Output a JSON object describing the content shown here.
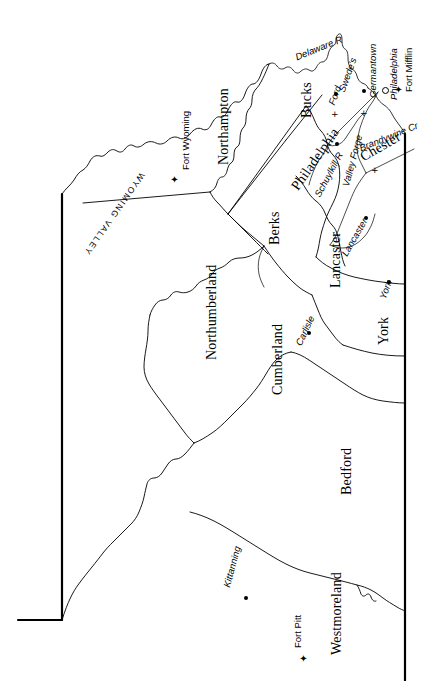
{
  "map": {
    "title": "Pennsylvania Counties, Revolutionary War Era",
    "stroke_color": "#000000",
    "background_color": "#ffffff",
    "border_stroke_width": "2.2",
    "county_stroke_width": "0.9",
    "river_stroke_width": "0.7"
  },
  "counties": [
    {
      "name": "Northampton",
      "rotation": -90
    },
    {
      "name": "Bucks",
      "rotation": -90
    },
    {
      "name": "Philadelphia",
      "rotation": -55
    },
    {
      "name": "Chester",
      "rotation": -30
    },
    {
      "name": "Berks",
      "rotation": -90
    },
    {
      "name": "Lancaster",
      "rotation": -90
    },
    {
      "name": "York",
      "rotation": -90
    },
    {
      "name": "Northumberland",
      "rotation": -90
    },
    {
      "name": "Cumberland",
      "rotation": -90
    },
    {
      "name": "Bedford",
      "rotation": -90
    },
    {
      "name": "Westmoreland",
      "rotation": -90
    }
  ],
  "towns": [
    {
      "name": "Germantown",
      "rotation": -90
    },
    {
      "name": "Philadelphia",
      "rotation": -90
    },
    {
      "name": "Swede's",
      "rotation": -70
    },
    {
      "name": "Ford",
      "rotation": -70
    },
    {
      "name": "Valley Forge",
      "rotation": -75
    },
    {
      "name": "Lancaster",
      "rotation": -60
    },
    {
      "name": "York",
      "rotation": -70
    },
    {
      "name": "Carlisle",
      "rotation": -65
    },
    {
      "name": "Kittanning",
      "rotation": -75
    }
  ],
  "forts": [
    {
      "name": "Fort Mifflin",
      "rotation": -90
    },
    {
      "name": "Fort Wyoming",
      "rotation": -90
    },
    {
      "name": "Fort Pitt",
      "rotation": -90
    }
  ],
  "rivers": [
    {
      "name": "Delaware R",
      "rotation": -22
    },
    {
      "name": "Schuylkill R",
      "rotation": -62
    },
    {
      "name": "Brandywine Cr",
      "rotation": -22
    }
  ],
  "regions": [
    {
      "name": "WYOMING VALLEY",
      "rotation": -235
    }
  ],
  "legend": {
    "city_marker": "open-circle",
    "town_marker": "filled-dot",
    "fort_marker": "star-fort",
    "battle_marker": "cross"
  }
}
